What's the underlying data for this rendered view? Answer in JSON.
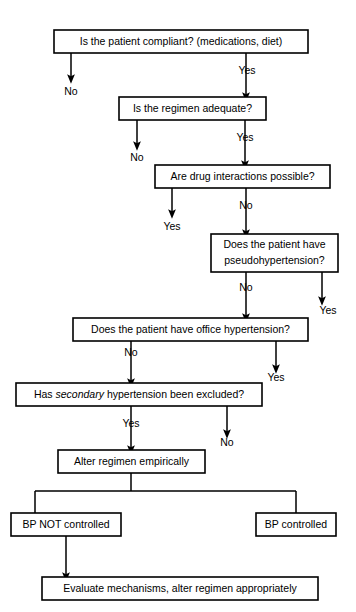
{
  "diagram": {
    "style": {
      "background_color": "#ffffff",
      "line_color": "#000000",
      "box_fill": "#ffffff",
      "text_color": "#000000"
    },
    "nodes": [
      {
        "id": "compliant",
        "label": "Is the patient compliant?  (medications, diet)",
        "x": 54,
        "y": 30,
        "w": 254,
        "h": 23
      },
      {
        "id": "regimen-adequate",
        "label": "Is the regimen adequate?",
        "x": 119,
        "y": 97,
        "w": 147,
        "h": 23
      },
      {
        "id": "drug-interactions",
        "label": "Are drug interactions possible?",
        "x": 155,
        "y": 165,
        "w": 175,
        "h": 23
      },
      {
        "id": "pseudohypertension",
        "label_line1": "Does the patient have",
        "label_line2": "pseudohypertension?",
        "x": 211,
        "y": 234,
        "w": 127,
        "h": 38
      },
      {
        "id": "office-hypertension",
        "label": "Does the patient have office hypertension?",
        "x": 73,
        "y": 318,
        "w": 235,
        "h": 23
      },
      {
        "id": "secondary-hypertension",
        "label_pre": "Has ",
        "label_italic": "secondary",
        "label_post": " hypertension been excluded?",
        "x": 16,
        "y": 383,
        "w": 246,
        "h": 23
      },
      {
        "id": "alter-regimen",
        "label": "Alter regimen empirically",
        "x": 58,
        "y": 450,
        "w": 147,
        "h": 23
      },
      {
        "id": "bp-not-controlled",
        "label": "BP NOT controlled",
        "x": 11,
        "y": 513,
        "w": 110,
        "h": 23
      },
      {
        "id": "bp-controlled",
        "label": "BP controlled",
        "x": 256,
        "y": 513,
        "w": 80,
        "h": 23
      },
      {
        "id": "evaluate-mechanisms",
        "label": "Evaluate mechanisms, alter regimen appropriately",
        "x": 42,
        "y": 577,
        "w": 276,
        "h": 23
      }
    ],
    "edge_labels": [
      {
        "id": "compliant-no",
        "text": "No",
        "x": 71,
        "y": 92
      },
      {
        "id": "compliant-yes",
        "text": "Yes",
        "x": 247,
        "y": 71
      },
      {
        "id": "regimen-no",
        "text": "No",
        "x": 137,
        "y": 158
      },
      {
        "id": "regimen-yes",
        "text": "Yes",
        "x": 245,
        "y": 138
      },
      {
        "id": "drug-interactions-yes",
        "text": "Yes",
        "x": 172,
        "y": 227
      },
      {
        "id": "drug-interactions-no",
        "text": "No",
        "x": 246,
        "y": 206
      },
      {
        "id": "pseudo-no",
        "text": "No",
        "x": 246,
        "y": 288
      },
      {
        "id": "pseudo-yes",
        "text": "Yes",
        "x": 328,
        "y": 311
      },
      {
        "id": "office-no",
        "text": "No",
        "x": 131,
        "y": 353
      },
      {
        "id": "office-yes",
        "text": "Yes",
        "x": 276,
        "y": 378
      },
      {
        "id": "secondary-yes",
        "text": "Yes",
        "x": 131,
        "y": 424
      },
      {
        "id": "secondary-no",
        "text": "No",
        "x": 227,
        "y": 443
      }
    ],
    "edges": [
      {
        "id": "compliant-to-no-end",
        "path": "M 71 53 L 71 79",
        "arrow": true
      },
      {
        "id": "compliant-to-regimen",
        "path": "M 246 53 L 246 97",
        "arrow": true,
        "label_gap": [
          62,
          80
        ]
      },
      {
        "id": "regimen-to-no-end",
        "path": "M 137 120 L 137 146",
        "arrow": true
      },
      {
        "id": "regimen-to-drug",
        "path": "M 245 120 L 245 165",
        "arrow": true,
        "label_gap": [
          129,
          147
        ]
      },
      {
        "id": "drug-to-yes-end",
        "path": "M 172 188 L 172 214",
        "arrow": true
      },
      {
        "id": "drug-to-pseudo",
        "path": "M 246 188 L 246 234",
        "arrow": true,
        "label_gap": [
          197,
          215
        ]
      },
      {
        "id": "pseudo-to-office",
        "path": "M 246 272 L 246 318",
        "arrow": true,
        "label_gap": [
          279,
          297
        ]
      },
      {
        "id": "pseudo-yes-down",
        "path": "M 322 272 L 322 301",
        "arrow": true
      },
      {
        "id": "office-to-secondary",
        "path": "M 131 341 L 131 383",
        "arrow": true,
        "label_gap": [
          344,
          362
        ]
      },
      {
        "id": "office-yes-down",
        "path": "M 276 341 L 276 369",
        "arrow": true
      },
      {
        "id": "secondary-to-alter",
        "path": "M 131 406 L 131 450",
        "arrow": true,
        "label_gap": [
          415,
          433
        ]
      },
      {
        "id": "secondary-no-down",
        "path": "M 227 406 L 227 434",
        "arrow": true
      },
      {
        "id": "alter-split",
        "path": "M 131 473 L 131 491 M 35 491 L 296 491 M 35 491 L 35 513 M 296 491 L 296 513",
        "arrow": false
      },
      {
        "id": "bpnot-to-evaluate",
        "path": "M 66 536 L 66 577",
        "arrow": true
      }
    ]
  }
}
